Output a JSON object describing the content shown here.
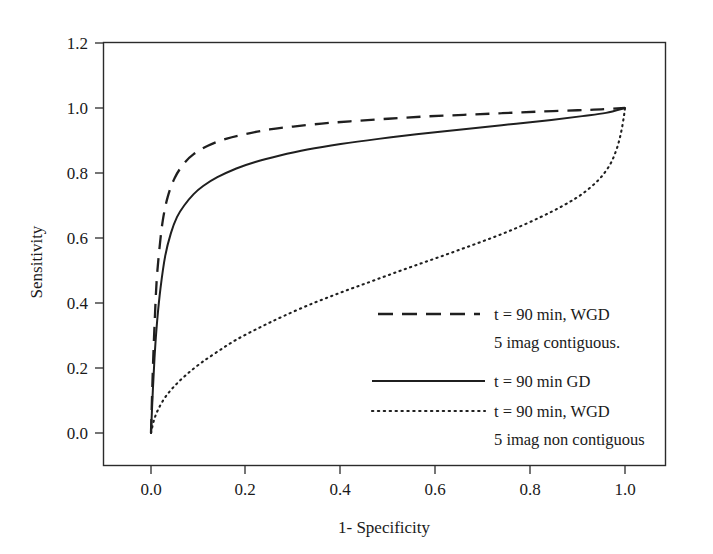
{
  "chart_data": {
    "type": "line",
    "title": "",
    "xlabel": "1- Specificity",
    "ylabel": "Sensitivity",
    "xlim": [
      -0.105,
      1.105
    ],
    "ylim": [
      -0.13,
      1.2
    ],
    "grid": false,
    "legend_position": "inside-lower-right",
    "xticks": [
      "0.0",
      "0.2",
      "0.4",
      "0.6",
      "0.8",
      "1.0"
    ],
    "xtick_values": [
      0.0,
      0.2,
      0.4,
      0.6,
      0.8,
      1.0
    ],
    "yticks": [
      "0.0",
      "0.2",
      "0.4",
      "0.6",
      "0.8",
      "1.0",
      "1.2"
    ],
    "ytick_values": [
      0.0,
      0.2,
      0.4,
      0.6,
      0.8,
      1.0,
      1.2
    ],
    "series": [
      {
        "name": "t = 90 min, WGD 5 imag contiguous.",
        "label_line1": "t = 90 min, WGD",
        "label_line2": "5 imag contiguous.",
        "style": "dashed",
        "color": "#1f1f1f",
        "auc_estimate": 0.95,
        "x": [
          0.0,
          0.004,
          0.008,
          0.012,
          0.018,
          0.025,
          0.035,
          0.05,
          0.07,
          0.09,
          0.12,
          0.16,
          0.2,
          0.25,
          0.3,
          0.36,
          0.42,
          0.5,
          0.58,
          0.66,
          0.74,
          0.82,
          0.9,
          0.95,
          1.0
        ],
        "y": [
          0.0,
          0.2,
          0.35,
          0.47,
          0.57,
          0.655,
          0.725,
          0.785,
          0.83,
          0.858,
          0.884,
          0.906,
          0.92,
          0.934,
          0.943,
          0.952,
          0.959,
          0.967,
          0.974,
          0.979,
          0.984,
          0.989,
          0.993,
          0.996,
          1.0
        ]
      },
      {
        "name": "t = 90 min GD",
        "label_line1": "t = 90 min GD",
        "label_line2": "",
        "style": "solid",
        "color": "#1f1f1f",
        "auc_estimate": 0.9,
        "x": [
          0.0,
          0.004,
          0.008,
          0.013,
          0.02,
          0.03,
          0.042,
          0.055,
          0.07,
          0.09,
          0.11,
          0.14,
          0.18,
          0.22,
          0.27,
          0.33,
          0.4,
          0.48,
          0.56,
          0.65,
          0.74,
          0.83,
          0.91,
          0.96,
          1.0
        ],
        "y": [
          0.0,
          0.135,
          0.245,
          0.345,
          0.445,
          0.545,
          0.615,
          0.665,
          0.7,
          0.735,
          0.76,
          0.787,
          0.814,
          0.834,
          0.853,
          0.872,
          0.889,
          0.905,
          0.919,
          0.933,
          0.947,
          0.961,
          0.975,
          0.985,
          1.0
        ]
      },
      {
        "name": "t = 90 min, WGD 5 imag non contiguous",
        "label_line1": "t = 90 min, WGD",
        "label_line2": "5 imag non contiguous",
        "style": "dotted",
        "color": "#1f1f1f",
        "auc_estimate": 0.65,
        "x": [
          0.0,
          0.006,
          0.015,
          0.03,
          0.05,
          0.075,
          0.105,
          0.14,
          0.18,
          0.23,
          0.28,
          0.34,
          0.4,
          0.46,
          0.52,
          0.58,
          0.64,
          0.7,
          0.76,
          0.82,
          0.87,
          0.91,
          0.945,
          0.968,
          0.982,
          0.991,
          0.997,
          1.0
        ],
        "y": [
          0.0,
          0.038,
          0.072,
          0.11,
          0.145,
          0.18,
          0.215,
          0.25,
          0.287,
          0.325,
          0.36,
          0.398,
          0.432,
          0.464,
          0.496,
          0.527,
          0.558,
          0.59,
          0.624,
          0.663,
          0.7,
          0.736,
          0.78,
          0.825,
          0.872,
          0.92,
          0.968,
          1.0
        ]
      }
    ],
    "legend_entries": [
      {
        "style": "dashed",
        "line1": "t = 90 min, WGD",
        "line2": "5 imag contiguous."
      },
      {
        "style": "solid",
        "line1": "t = 90 min GD",
        "line2": ""
      },
      {
        "style": "dotted",
        "line1": "t = 90 min, WGD",
        "line2": "5 imag non contiguous"
      }
    ]
  }
}
